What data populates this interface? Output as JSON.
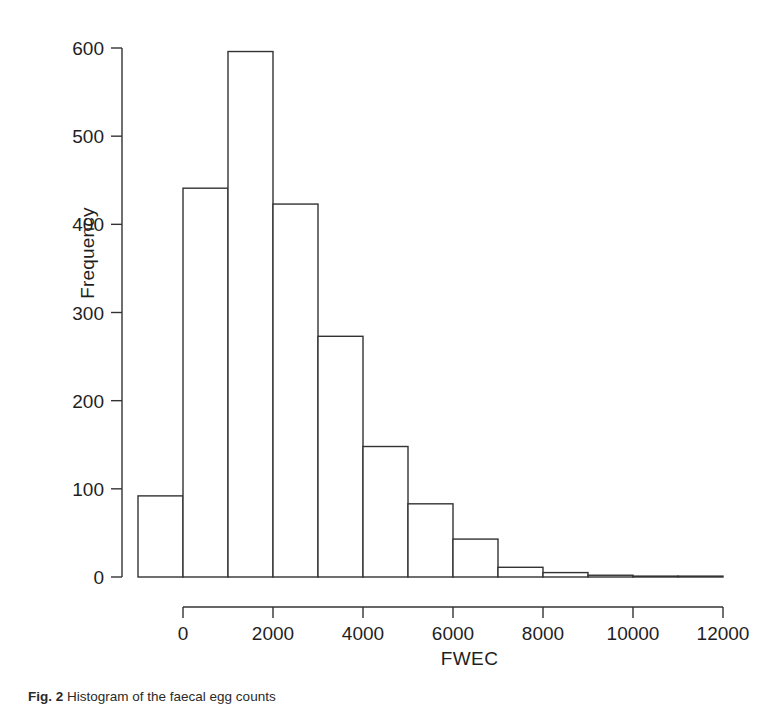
{
  "figure": {
    "caption_label": "Fig. 2",
    "caption_text": "Histogram of the faecal egg counts"
  },
  "chart_data": {
    "type": "bar",
    "title": "",
    "subtitle": "",
    "xlabel": "FWEC",
    "ylabel": "Frequency",
    "grid": false,
    "legend": "none",
    "xlim": [
      -1000,
      12000
    ],
    "ylim": [
      0,
      600
    ],
    "x_ticks": [
      0,
      2000,
      4000,
      6000,
      8000,
      10000,
      12000
    ],
    "x_tick_labels": [
      "0",
      "2000",
      "4000",
      "6000",
      "8000",
      "10000",
      "12000"
    ],
    "y_ticks": [
      0,
      100,
      200,
      300,
      400,
      500,
      600
    ],
    "y_tick_labels": [
      "0",
      "100",
      "200",
      "300",
      "400",
      "500",
      "600"
    ],
    "bin_width": 1000,
    "bin_starts": [
      -1000,
      0,
      1000,
      2000,
      3000,
      4000,
      5000,
      6000,
      7000,
      8000,
      9000,
      10000,
      11000
    ],
    "bin_ends": [
      0,
      1000,
      2000,
      3000,
      4000,
      5000,
      6000,
      7000,
      8000,
      9000,
      10000,
      11000,
      12000
    ],
    "categories": [
      "-1000-0",
      "0-1000",
      "1000-2000",
      "2000-3000",
      "3000-4000",
      "4000-5000",
      "5000-6000",
      "6000-7000",
      "7000-8000",
      "8000-9000",
      "9000-10000",
      "10000-11000",
      "11000-12000"
    ],
    "values": [
      92,
      441,
      596,
      423,
      273,
      148,
      83,
      43,
      11,
      5,
      2,
      1,
      1
    ],
    "bar_fill": "#ffffff",
    "bar_stroke": "#333333",
    "axis_color": "#333333"
  }
}
